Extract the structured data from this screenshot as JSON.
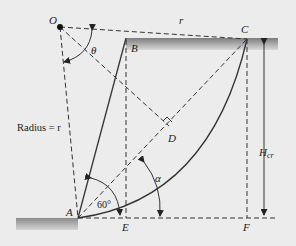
{
  "diagram": {
    "points": {
      "O": "O",
      "A": "A",
      "B": "B",
      "C": "C",
      "D": "D",
      "E": "E",
      "F": "F"
    },
    "labels": {
      "radius": "Radius = r",
      "r": "r",
      "theta": "θ",
      "alpha": "α",
      "angle_60": "60°",
      "height_main": "H",
      "height_sub": "cr"
    },
    "colors": {
      "background": "#ececec",
      "line": "#333333",
      "ground_dark": "#7d7d7d",
      "ground_light": "#cfcfcf"
    }
  }
}
